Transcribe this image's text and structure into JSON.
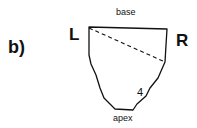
{
  "figure": {
    "panel_label": "b)",
    "labels": {
      "base": "base",
      "apex": "apex",
      "left": "L",
      "right": "R",
      "number": "4"
    },
    "colors": {
      "stroke": "#111111",
      "background": "#ffffff"
    }
  }
}
